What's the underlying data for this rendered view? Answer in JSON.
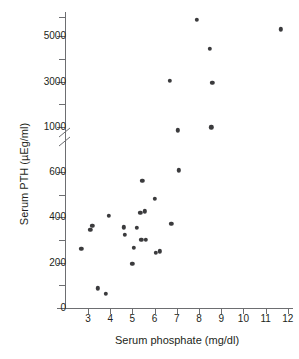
{
  "chart_data": {
    "type": "scatter",
    "title": "",
    "xlabel": "Serum phosphate (mg/dl)",
    "ylabel": "Serum PTH (µEg/ml)",
    "xlim": [
      2.55,
      12.35
    ],
    "xticks": [
      3,
      4,
      5,
      6,
      7,
      8,
      9,
      10,
      11,
      12
    ],
    "xticklabels": [
      "3",
      "4",
      "5",
      "6",
      "7",
      "8",
      "9",
      "10",
      "11",
      "12"
    ],
    "yticks_lower": [
      0,
      200,
      400,
      600
    ],
    "yticklabels_lower": [
      "0",
      "200",
      "400",
      "600"
    ],
    "yticks_upper": [
      1000,
      3000,
      5000
    ],
    "yticklabels_upper": [
      "1000",
      "3000",
      "5000"
    ],
    "y_axis_break": true,
    "y_axis_break_note": "broken axis between 600 and 1000",
    "grid": false,
    "legend": false,
    "marker": "filled-circle",
    "marker_color": "#3b3b3d",
    "axis_color": "#6d6e71",
    "n_points": 28,
    "x": [
      2.7,
      3.1,
      3.2,
      3.45,
      3.8,
      3.95,
      4.6,
      4.65,
      5.0,
      5.05,
      5.2,
      5.35,
      5.4,
      5.45,
      5.55,
      5.6,
      6.0,
      6.05,
      6.25,
      6.7,
      6.75,
      7.05,
      7.1,
      7.9,
      8.5,
      8.55,
      8.6,
      11.7
    ],
    "y": [
      262,
      345,
      362,
      87,
      64,
      408,
      356,
      324,
      194,
      266,
      355,
      419,
      302,
      560,
      427,
      302,
      481,
      245,
      250,
      3020,
      370,
      860,
      607,
      5700,
      4450,
      985,
      2940,
      5300
    ],
    "points": [
      {
        "x": 2.7,
        "y": 262
      },
      {
        "x": 3.1,
        "y": 345
      },
      {
        "x": 3.2,
        "y": 362
      },
      {
        "x": 3.45,
        "y": 87
      },
      {
        "x": 3.8,
        "y": 64
      },
      {
        "x": 3.95,
        "y": 408
      },
      {
        "x": 4.6,
        "y": 356
      },
      {
        "x": 4.65,
        "y": 324
      },
      {
        "x": 5.0,
        "y": 194
      },
      {
        "x": 5.05,
        "y": 266
      },
      {
        "x": 5.2,
        "y": 355
      },
      {
        "x": 5.35,
        "y": 419
      },
      {
        "x": 5.4,
        "y": 302
      },
      {
        "x": 5.45,
        "y": 560
      },
      {
        "x": 5.55,
        "y": 427
      },
      {
        "x": 5.6,
        "y": 302
      },
      {
        "x": 6.0,
        "y": 481
      },
      {
        "x": 6.05,
        "y": 245
      },
      {
        "x": 6.25,
        "y": 250
      },
      {
        "x": 6.7,
        "y": 3020
      },
      {
        "x": 6.75,
        "y": 370
      },
      {
        "x": 7.05,
        "y": 860
      },
      {
        "x": 7.1,
        "y": 607
      },
      {
        "x": 7.9,
        "y": 5700
      },
      {
        "x": 8.5,
        "y": 4450
      },
      {
        "x": 8.55,
        "y": 985
      },
      {
        "x": 8.6,
        "y": 2940
      },
      {
        "x": 11.7,
        "y": 5300
      }
    ]
  }
}
